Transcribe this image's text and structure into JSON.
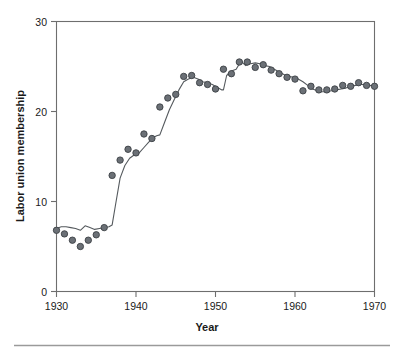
{
  "chart_data": {
    "type": "scatter",
    "title": "",
    "xlabel": "Year",
    "ylabel": "Labor union membership",
    "xlim": [
      1929,
      1971
    ],
    "ylim": [
      0,
      30
    ],
    "xticks": [
      1930,
      1940,
      1950,
      1960,
      1970
    ],
    "xtick_labels": [
      "1930",
      "1940",
      "1950",
      "1960",
      "1970"
    ],
    "yticks": [
      0,
      10,
      20,
      30
    ],
    "ytick_labels": [
      "0",
      "10",
      "20",
      "30"
    ],
    "grid": false,
    "legend": null,
    "series": [
      {
        "name": "Labor union membership",
        "kind": "scatter",
        "marker": "filled-circle",
        "color": "#6b7076",
        "x": [
          1930,
          1931,
          1932,
          1933,
          1934,
          1935,
          1936,
          1937,
          1938,
          1939,
          1940,
          1941,
          1942,
          1943,
          1944,
          1945,
          1946,
          1947,
          1948,
          1949,
          1950,
          1951,
          1952,
          1953,
          1954,
          1955,
          1956,
          1957,
          1958,
          1959,
          1960,
          1961,
          1962,
          1963,
          1964,
          1965,
          1966,
          1967,
          1968,
          1969,
          1970
        ],
        "y": [
          6.8,
          6.4,
          5.7,
          5.0,
          5.7,
          6.3,
          7.1,
          12.9,
          14.6,
          15.8,
          15.4,
          17.5,
          17.0,
          20.5,
          21.5,
          21.9,
          23.9,
          24.0,
          23.2,
          23.0,
          22.5,
          24.7,
          24.2,
          25.5,
          25.5,
          24.9,
          25.2,
          24.6,
          24.2,
          23.8,
          23.6,
          22.3,
          22.8,
          22.4,
          22.4,
          22.5,
          22.9,
          22.8,
          23.2,
          22.9,
          22.8
        ]
      },
      {
        "name": "Smoothed fit",
        "kind": "line",
        "color": "#555a5e",
        "x": [
          1930.0,
          1930.6,
          1931.2,
          1931.8,
          1932.4,
          1933.0,
          1933.6,
          1934.2,
          1934.8,
          1935.4,
          1936.0,
          1936.6,
          1937.0,
          1937.4,
          1938.0,
          1938.6,
          1939.2,
          1939.8,
          1940.4,
          1941.0,
          1941.6,
          1942.2,
          1942.6,
          1943.0,
          1943.6,
          1944.2,
          1944.8,
          1945.4,
          1946.0,
          1946.6,
          1947.2,
          1947.8,
          1948.4,
          1949.0,
          1949.6,
          1950.2,
          1950.8,
          1951.0,
          1951.4,
          1952.0,
          1952.6,
          1953.2,
          1953.8,
          1954.4,
          1955.0,
          1955.6,
          1956.2,
          1956.8,
          1957.4,
          1958.0,
          1958.6,
          1959.2,
          1959.8,
          1960.4,
          1961.0,
          1961.6,
          1962.2,
          1962.8,
          1963.4,
          1964.0,
          1964.6,
          1965.2,
          1965.8,
          1966.4,
          1967.0,
          1967.6,
          1968.2,
          1968.8,
          1969.4,
          1970.0
        ],
        "y": [
          7.0,
          7.2,
          7.2,
          7.1,
          7.0,
          6.8,
          7.3,
          7.1,
          6.9,
          7.0,
          7.1,
          7.2,
          7.4,
          9.5,
          12.6,
          14.0,
          14.8,
          15.2,
          15.4,
          16.0,
          16.6,
          17.1,
          17.3,
          17.4,
          18.8,
          20.2,
          21.3,
          22.4,
          23.3,
          23.6,
          23.8,
          23.6,
          23.3,
          23.2,
          23.0,
          22.7,
          22.4,
          22.4,
          24.0,
          24.5,
          24.7,
          25.6,
          25.1,
          25.3,
          25.4,
          25.3,
          25.1,
          25.0,
          24.7,
          24.4,
          24.1,
          23.9,
          23.8,
          23.6,
          23.3,
          22.9,
          22.5,
          22.3,
          22.2,
          22.2,
          22.3,
          22.4,
          22.5,
          22.6,
          22.8,
          22.9,
          23.0,
          23.0,
          22.9,
          22.8
        ]
      }
    ]
  },
  "figure": {
    "y_axis_title": "Labor union membership",
    "x_axis_title": "Year",
    "marker_color": "#6b7076",
    "line_color": "#555a5e",
    "frame_color": "#6e6e6e",
    "footer_rule_color": "#9a9a9a"
  }
}
